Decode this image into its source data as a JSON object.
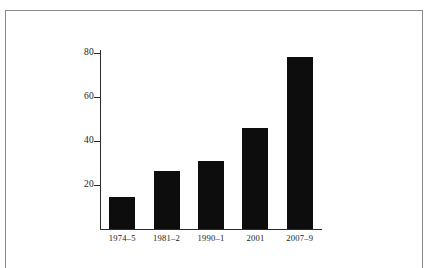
{
  "chart_data": {
    "type": "bar",
    "title": "",
    "subtitle": "",
    "xlabel": "",
    "ylabel": "",
    "categories": [
      "1974–5",
      "1981–2",
      "1990–1",
      "2001",
      "2007–9"
    ],
    "values": [
      14.5,
      26.5,
      31,
      46,
      78
    ],
    "ylim": [
      0,
      84
    ],
    "yticks": [
      20,
      40,
      60,
      80
    ],
    "ytick_labels": [
      "20",
      "40",
      "60",
      "80"
    ],
    "grid": false,
    "legend": null,
    "series": [
      {
        "name": "",
        "values": [
          14.5,
          26.5,
          31,
          46,
          78
        ]
      }
    ],
    "colors": {
      "bar_fill": "#0d0d0d",
      "axis": "#2b2b2b",
      "frame": "#8a8a8a",
      "text": "#1a1a1a",
      "background": "#ffffff"
    }
  },
  "figure": {
    "frame_visible": true
  }
}
